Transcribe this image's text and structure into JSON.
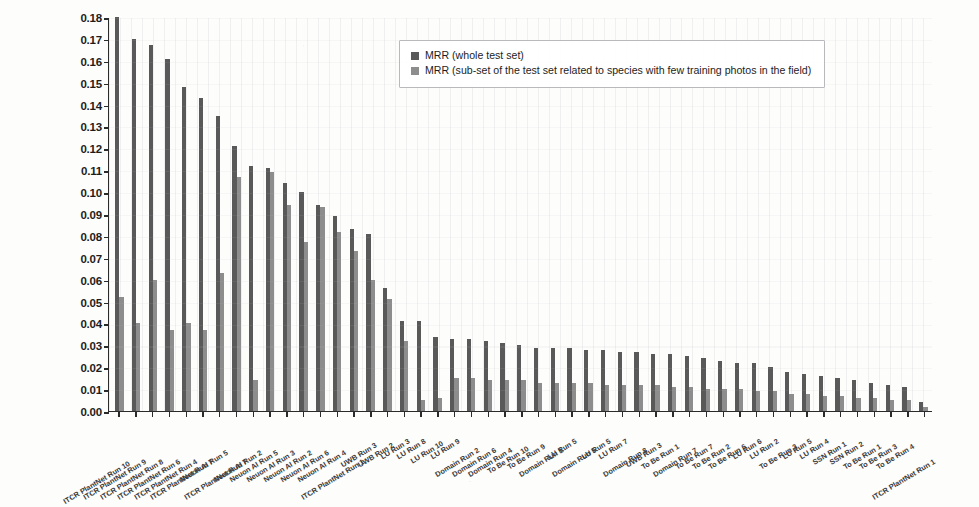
{
  "chart_data": {
    "type": "bar",
    "title": "",
    "xlabel": "",
    "ylabel": "",
    "ylim": [
      0.0,
      0.18
    ],
    "grid": "vertical-dotted",
    "legend_position": "top-center",
    "ytick_labels": [
      "0.18",
      "0.17",
      "0.16",
      "0.15",
      "0.14",
      "0.13",
      "0.12",
      "0.11",
      "0.10",
      "0.09",
      "0.08",
      "0.07",
      "0.06",
      "0.05",
      "0.04",
      "0.03",
      "0.02",
      "0.01",
      "0.00"
    ],
    "categories": [
      "ITCR PlantNet Run 10",
      "ITCR PlantNet Run 9",
      "ITCR PlantNet Run 8",
      "ITCR PlantNet Run 6",
      "ITCR PlantNet Run 4",
      "ITCR PlantNet Run 7",
      "Neuon AI Run 5",
      "ITCR PlantNet Run 7",
      "Neuon AI Run 2",
      "Neuon AI Run 5",
      "Neuon AI Run 3",
      "Neuon AI Run 2",
      "Neuon AI Run 6",
      "Neuon AI Run 4",
      "ITCR PlantNet Run 1",
      "UWB Run 3",
      "UWB Run 2",
      "LU Run 3",
      "LU Run 8",
      "LU Run 10",
      "LU Run 9",
      "Domain Run 2",
      "Domain Run 6",
      "Domain Run 4",
      "To Be Run 10",
      "To Be Run 9",
      "Domain Run 1",
      "LU Run 5",
      "Domain Run 5",
      "LU Run 5",
      "LU Run 7",
      "Domain Run 8",
      "UWB Run 3",
      "To Be Run 1",
      "Domain Run 7",
      "To Be Run 7",
      "To Be Run 2",
      "To Be Run 6",
      "LU Run 6",
      "LU Run 2",
      "To Be Run 3",
      "LU Run 5",
      "LU Run 4",
      "SSN Run 1",
      "SSN Run 2",
      "To Be Run 1",
      "To Be Run 3",
      "To Be Run 4",
      "ITCR PlantNet Run 1"
    ],
    "series": [
      {
        "name": "MRR (whole test set)",
        "color": "#595959",
        "values": [
          0.18,
          0.17,
          0.167,
          0.161,
          0.148,
          0.143,
          0.135,
          0.121,
          0.112,
          0.111,
          0.104,
          0.1,
          0.094,
          0.089,
          0.083,
          0.081,
          0.056,
          0.041,
          0.041,
          0.034,
          0.033,
          0.033,
          0.032,
          0.031,
          0.03,
          0.029,
          0.029,
          0.029,
          0.028,
          0.028,
          0.027,
          0.027,
          0.026,
          0.026,
          0.025,
          0.024,
          0.023,
          0.022,
          0.022,
          0.02,
          0.018,
          0.017,
          0.016,
          0.015,
          0.014,
          0.013,
          0.012,
          0.011,
          0.004
        ]
      },
      {
        "name": "MRR (sub-set of the test set related to species with few training photos in the field)",
        "color": "#8d8d8d",
        "values": [
          0.052,
          0.04,
          0.06,
          0.037,
          0.04,
          0.037,
          0.063,
          0.107,
          0.014,
          0.109,
          0.094,
          0.077,
          0.093,
          0.082,
          0.073,
          0.06,
          0.051,
          0.032,
          0.005,
          0.006,
          0.015,
          0.015,
          0.014,
          0.014,
          0.014,
          0.013,
          0.013,
          0.013,
          0.013,
          0.012,
          0.012,
          0.012,
          0.012,
          0.011,
          0.011,
          0.01,
          0.01,
          0.01,
          0.009,
          0.009,
          0.008,
          0.008,
          0.007,
          0.007,
          0.006,
          0.006,
          0.005,
          0.005,
          0.002
        ]
      }
    ]
  },
  "legend": {
    "items": [
      {
        "label": "MRR (whole test set)",
        "swatch": "whole"
      },
      {
        "label": "MRR (sub-set of the test set related to species with few training photos in the field)",
        "swatch": "subset"
      }
    ]
  }
}
